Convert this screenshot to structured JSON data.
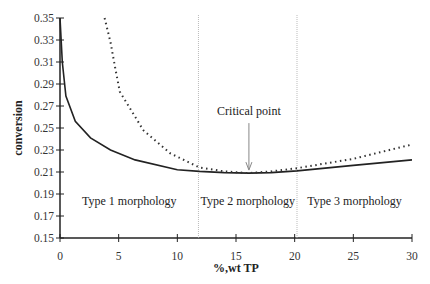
{
  "chart_data": {
    "type": "line",
    "title": "",
    "xlabel": "%,wt TP",
    "ylabel": "conversion",
    "xlim": [
      0,
      30
    ],
    "ylim": [
      0.15,
      0.35
    ],
    "xticks": [
      0,
      5,
      10,
      15,
      20,
      25,
      30
    ],
    "yticks": [
      0.15,
      0.17,
      0.19,
      0.21,
      0.23,
      0.25,
      0.27,
      0.29,
      0.31,
      0.33,
      0.35
    ],
    "grid": false,
    "legend": null,
    "series": [
      {
        "name": "solid curve",
        "style": "solid",
        "x": [
          0,
          0.2,
          0.5,
          1.3,
          2.6,
          4.3,
          6.4,
          10,
          11.9,
          14,
          16.1,
          18,
          20.2,
          25,
          30
        ],
        "y": [
          0.35,
          0.31,
          0.279,
          0.256,
          0.241,
          0.23,
          0.221,
          0.212,
          0.2105,
          0.2095,
          0.209,
          0.2095,
          0.211,
          0.216,
          0.221
        ]
      },
      {
        "name": "dotted curve",
        "style": "dotted",
        "x": [
          3.8,
          4.3,
          4.7,
          5.1,
          7.1,
          9.4,
          11.9,
          14,
          16.1,
          18,
          20.2,
          25,
          30
        ],
        "y": [
          0.35,
          0.328,
          0.305,
          0.283,
          0.248,
          0.227,
          0.214,
          0.2105,
          0.209,
          0.2105,
          0.2135,
          0.222,
          0.235
        ]
      }
    ],
    "vertical_lines": [
      {
        "x": 11.8,
        "style": "dotted"
      },
      {
        "x": 20.2,
        "style": "dotted"
      }
    ],
    "annotations": [
      {
        "text": "Critical point",
        "x": 16.1,
        "y": 0.209,
        "arrow": true
      },
      {
        "text": "Type 1 morphology",
        "region": [
          0,
          11.8
        ]
      },
      {
        "text": "Type 2 morphology",
        "region": [
          11.8,
          20.2
        ]
      },
      {
        "text": "Type 3 morphology",
        "region": [
          20.2,
          30
        ]
      }
    ]
  }
}
